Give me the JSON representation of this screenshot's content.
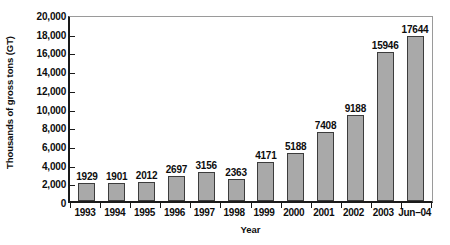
{
  "chart_data": {
    "type": "bar",
    "title": "",
    "xlabel": "Year",
    "ylabel": "Thousands of gross tons (GT)",
    "categories": [
      "1993",
      "1994",
      "1995",
      "1996",
      "1997",
      "1998",
      "1999",
      "2000",
      "2001",
      "2002",
      "2003",
      "Jun–04"
    ],
    "values": [
      1929,
      1901,
      2012,
      2697,
      3156,
      2363,
      4171,
      5188,
      7408,
      9188,
      15946,
      17644
    ],
    "data_labels": [
      "1929",
      "1901",
      "2012",
      "2697",
      "3156",
      "2363",
      "4171",
      "5188",
      "7408",
      "9188",
      "15946",
      "17644"
    ],
    "ylim": [
      0,
      20000
    ],
    "ytick_values": [
      0,
      2000,
      4000,
      6000,
      8000,
      10000,
      12000,
      14000,
      16000,
      18000,
      20000
    ],
    "ytick_labels": [
      "0",
      "2,000",
      "4,000",
      "6,000",
      "8,000",
      "10,000",
      "12,000",
      "14,000",
      "16,000",
      "18,000",
      "20,000"
    ],
    "grid": false,
    "legend": null,
    "bar_color": "#a9a9a9",
    "bar_border_color": "#3c3c3c",
    "axis_color": "#1a1a1a"
  }
}
